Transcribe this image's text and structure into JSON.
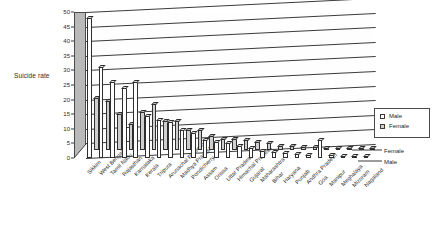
{
  "chart_data": {
    "type": "bar",
    "title": "",
    "xlabel": "",
    "ylabel": "Suicide rate",
    "ylim": [
      0,
      50
    ],
    "yticks": [
      0,
      5,
      10,
      15,
      20,
      25,
      30,
      35,
      40,
      45,
      50
    ],
    "grid": true,
    "legend_position": "right",
    "series_axis_labels": [
      "Female",
      "Male"
    ],
    "categories": [
      "Sikkim",
      "West Bengal",
      "Tamil Nadu",
      "Rajasthan",
      "Karnataka",
      "Kerala",
      "Tripura",
      "Arunachal Pradesh",
      "Madhya Pradesh",
      "Pondicherry",
      "Assam",
      "Orissa",
      "Uttar Pradesh",
      "Himachal Pradesh",
      "Gujarat",
      "Maharashtra",
      "Bihar",
      "Haryana",
      "Punjab",
      "Andhra Pradesh",
      "Goa",
      "Manipur",
      "Meghalaya",
      "Mizoram",
      "Nagaland"
    ],
    "series": [
      {
        "name": "Male",
        "color": "#ffffff",
        "values": [
          48,
          31,
          26,
          24,
          26,
          14.5,
          13,
          12.5,
          9.5,
          8.5,
          6,
          5.5,
          5,
          4,
          3.5,
          2.5,
          2,
          1.8,
          1.5,
          1.2,
          6,
          1,
          0.8,
          0.6,
          0.4
        ]
      },
      {
        "name": "Female",
        "color": "#cfcfcf",
        "values": [
          18,
          17,
          12.5,
          9,
          13,
          16,
          10,
          10,
          7,
          7,
          5,
          4,
          4,
          3.5,
          3,
          2.5,
          1.5,
          1.4,
          1.2,
          1,
          0.8,
          0.7,
          0.5,
          0.4,
          0.3
        ]
      }
    ]
  },
  "legend": {
    "items": [
      {
        "label": "Male",
        "color": "#ffffff"
      },
      {
        "label": "Female",
        "color": "#cfcfcf"
      }
    ]
  }
}
